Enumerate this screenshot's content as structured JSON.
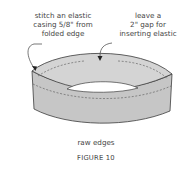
{
  "figure": {
    "title": "FIGURE 10",
    "annotations": {
      "left": {
        "lines": [
          "stitch an elastic",
          "casing 5/8\" from",
          "folded edge"
        ]
      },
      "right": {
        "lines": [
          "leave a",
          "2\" gap for",
          "inserting elastic"
        ]
      },
      "bottom": {
        "text": "raw edges"
      }
    },
    "colors": {
      "band_fill": "#cfcfcf",
      "band_outer_shade": "#c4c4c4",
      "outline": "#3c3c3c",
      "stitch": "#555555",
      "text": "#444444"
    }
  }
}
